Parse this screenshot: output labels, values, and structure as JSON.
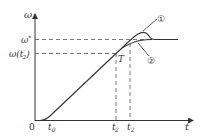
{
  "diagram": {
    "type": "line",
    "axes": {
      "y_label": "ω",
      "x_label": "t",
      "origin_label": "0"
    },
    "y_ticks": [
      {
        "label": "ω*",
        "sup": "*",
        "base": "ω"
      },
      {
        "label": "ω(t₂′)",
        "base": "ω(t",
        "sub": "2",
        "prime": "′",
        "close": ")"
      }
    ],
    "x_ticks": [
      {
        "label": "t₀",
        "base": "t",
        "sub": "0"
      },
      {
        "label": "t₂′",
        "base": "t",
        "sub": "2",
        "prime": "′"
      },
      {
        "label": "t₂",
        "base": "t",
        "sub": "2"
      }
    ],
    "point_label": "T",
    "curve_labels": {
      "curve1": "①",
      "curve2": "②"
    },
    "colors": {
      "line": "#333333",
      "dash": "#555555",
      "background": "#ffffff"
    }
  }
}
